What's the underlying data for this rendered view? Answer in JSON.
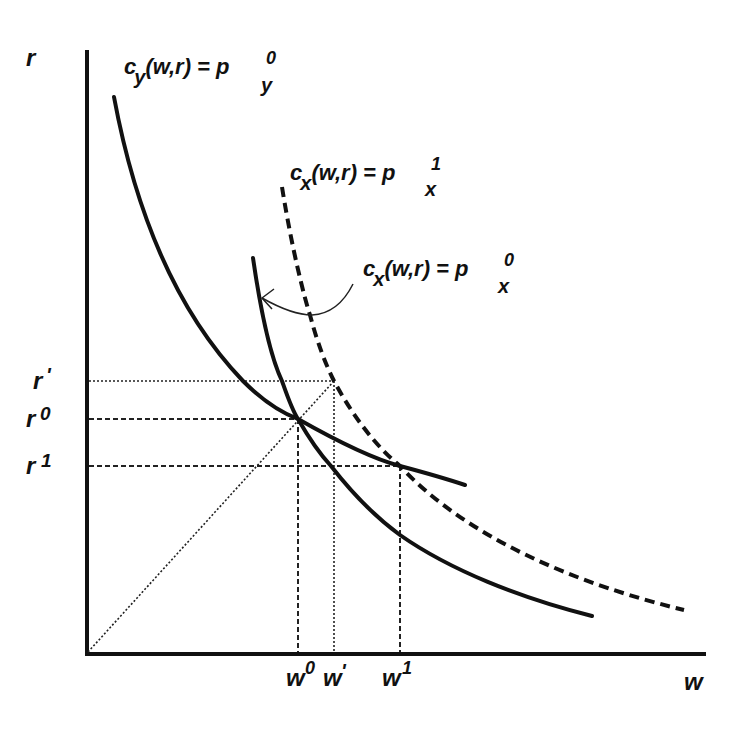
{
  "diagram": {
    "axes": {
      "y_label": "r",
      "x_label": "w"
    },
    "curves": {
      "cy": {
        "lhs": "c",
        "lhs_sub": "y",
        "args": "(w,r) = p",
        "rhs_sub": "y",
        "rhs_sup": "0",
        "style": "solid"
      },
      "cx1": {
        "lhs": "c",
        "lhs_sub": "x",
        "args": "(w,r) = p",
        "rhs_sub": "x",
        "rhs_sup": "1",
        "style": "dashed"
      },
      "cx0": {
        "lhs": "c",
        "lhs_sub": "x",
        "args": "(w,r) = p",
        "rhs_sub": "x",
        "rhs_sup": "0",
        "style": "solid",
        "annotated_by_arrow": true
      }
    },
    "y_ticks": [
      {
        "base": "r",
        "sup": "'",
        "line": "dotted"
      },
      {
        "base": "r",
        "sup": "0",
        "line": "dashed"
      },
      {
        "base": "r",
        "sup": "1",
        "line": "dashed"
      }
    ],
    "x_ticks": [
      {
        "base": "w",
        "sup": "0",
        "line": "dashed"
      },
      {
        "base": "w",
        "sup": "'",
        "line": "dotted"
      },
      {
        "base": "w",
        "sup": "1",
        "line": "dashed"
      }
    ],
    "ray_from_origin": "dotted 45° line through (w', r')"
  }
}
